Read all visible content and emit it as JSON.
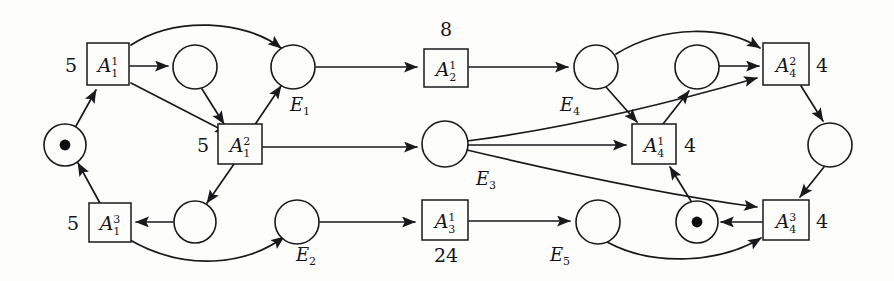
{
  "diagram": {
    "kind": "petri-net",
    "width": 894,
    "height": 281,
    "background_color": "#fdfdfb",
    "ink_color": "#19191c"
  },
  "transitions": [
    {
      "id": "a11",
      "base": "A",
      "sup": "1",
      "sub": "1",
      "weight": "5",
      "weight_pos": "left",
      "x": 108,
      "y": 64,
      "w": 42,
      "h": 42
    },
    {
      "id": "a12",
      "base": "A",
      "sup": "2",
      "sub": "1",
      "weight": "5",
      "weight_pos": "left",
      "x": 240,
      "y": 144,
      "w": 44,
      "h": 40
    },
    {
      "id": "a13",
      "base": "A",
      "sup": "3",
      "sub": "1",
      "weight": "5",
      "weight_pos": "left",
      "x": 110,
      "y": 222,
      "w": 42,
      "h": 39
    },
    {
      "id": "a21",
      "base": "A",
      "sup": "1",
      "sub": "2",
      "weight": "8",
      "weight_pos": "top",
      "x": 446,
      "y": 68,
      "w": 44,
      "h": 38
    },
    {
      "id": "a31",
      "base": "A",
      "sup": "1",
      "sub": "3",
      "weight": "24",
      "weight_pos": "bottom",
      "x": 445,
      "y": 220,
      "w": 46,
      "h": 40
    },
    {
      "id": "a41",
      "base": "A",
      "sup": "1",
      "sub": "4",
      "weight": "4",
      "weight_pos": "right",
      "x": 654,
      "y": 144,
      "w": 44,
      "h": 40
    },
    {
      "id": "a42",
      "base": "A",
      "sup": "2",
      "sub": "4",
      "weight": "4",
      "weight_pos": "right",
      "x": 786,
      "y": 64,
      "w": 46,
      "h": 42
    },
    {
      "id": "a43",
      "base": "A",
      "sup": "3",
      "sub": "4",
      "weight": "4",
      "weight_pos": "right",
      "x": 786,
      "y": 220,
      "w": 46,
      "h": 40
    }
  ],
  "places": [
    {
      "id": "p_start",
      "x": 65,
      "y": 145,
      "r": 21,
      "tokens": 1,
      "label": ""
    },
    {
      "id": "p_u1",
      "x": 195,
      "y": 67,
      "r": 22,
      "tokens": 0,
      "label": ""
    },
    {
      "id": "p_e1",
      "x": 293,
      "y": 67,
      "r": 22,
      "tokens": 0,
      "label": "E",
      "label_sub": "1",
      "label_x": 300,
      "label_y": 104
    },
    {
      "id": "p_l1",
      "x": 195,
      "y": 222,
      "r": 21,
      "tokens": 0,
      "label": ""
    },
    {
      "id": "p_e2",
      "x": 297,
      "y": 222,
      "r": 22,
      "tokens": 0,
      "label": "E",
      "label_sub": "2",
      "label_x": 306,
      "label_y": 254
    },
    {
      "id": "p_e3",
      "x": 445,
      "y": 144,
      "r": 23,
      "tokens": 0,
      "label": "E",
      "label_sub": "3",
      "label_x": 486,
      "label_y": 178
    },
    {
      "id": "p_e4",
      "x": 596,
      "y": 67,
      "r": 22,
      "tokens": 0,
      "label": "E",
      "label_sub": "4",
      "label_x": 570,
      "label_y": 104
    },
    {
      "id": "p_u2",
      "x": 697,
      "y": 67,
      "r": 22,
      "tokens": 0,
      "label": ""
    },
    {
      "id": "p_e5",
      "x": 598,
      "y": 222,
      "r": 22,
      "tokens": 0,
      "label": "E",
      "label_sub": "5",
      "label_x": 560,
      "label_y": 254
    },
    {
      "id": "p_tok2",
      "x": 697,
      "y": 222,
      "r": 21,
      "tokens": 1,
      "label": ""
    },
    {
      "id": "p_right",
      "x": 830,
      "y": 145,
      "r": 22,
      "tokens": 0,
      "label": ""
    }
  ],
  "arcs": [
    {
      "id": "arc-start-a11",
      "from": "p_start",
      "to": "a11",
      "shape": "line"
    },
    {
      "id": "arc-a11-u1",
      "from": "a11",
      "to": "p_u1",
      "shape": "line"
    },
    {
      "id": "arc-a11-e1",
      "from": "a11",
      "to": "p_e1",
      "shape": "curve-over"
    },
    {
      "id": "arc-a11-a12",
      "from": "a11",
      "to": "a12",
      "shape": "line"
    },
    {
      "id": "arc-u1-a12",
      "from": "p_u1",
      "to": "a12",
      "shape": "line"
    },
    {
      "id": "arc-a12-e1",
      "from": "a12",
      "to": "p_e1",
      "shape": "line"
    },
    {
      "id": "arc-a12-e3",
      "from": "a12",
      "to": "p_e3",
      "shape": "line"
    },
    {
      "id": "arc-a12-l1",
      "from": "a12",
      "to": "p_l1",
      "shape": "line"
    },
    {
      "id": "arc-l1-a13",
      "from": "p_l1",
      "to": "a13",
      "shape": "line"
    },
    {
      "id": "arc-a13-start",
      "from": "a13",
      "to": "p_start",
      "shape": "line"
    },
    {
      "id": "arc-a13-e2",
      "from": "a13",
      "to": "p_e2",
      "shape": "curve-under"
    },
    {
      "id": "arc-e1-a21",
      "from": "p_e1",
      "to": "a21",
      "shape": "line"
    },
    {
      "id": "arc-a21-e4",
      "from": "a21",
      "to": "p_e4",
      "shape": "line"
    },
    {
      "id": "arc-e2-a31",
      "from": "p_e2",
      "to": "a31",
      "shape": "line"
    },
    {
      "id": "arc-a31-e5",
      "from": "a31",
      "to": "p_e5",
      "shape": "line"
    },
    {
      "id": "arc-e3-a41",
      "from": "p_e3",
      "to": "a41",
      "shape": "line"
    },
    {
      "id": "arc-e3-a42",
      "from": "p_e3",
      "to": "a42",
      "shape": "curve"
    },
    {
      "id": "arc-e3-a43",
      "from": "p_e3",
      "to": "a43",
      "shape": "curve"
    },
    {
      "id": "arc-e4-a41",
      "from": "p_e4",
      "to": "a41",
      "shape": "line"
    },
    {
      "id": "arc-e4-a42",
      "from": "p_e4",
      "to": "a42",
      "shape": "curve-over"
    },
    {
      "id": "arc-a41-u2",
      "from": "a41",
      "to": "p_u2",
      "shape": "line"
    },
    {
      "id": "arc-u2-a42",
      "from": "p_u2",
      "to": "a42",
      "shape": "line"
    },
    {
      "id": "arc-a42-right",
      "from": "a42",
      "to": "p_right",
      "shape": "line"
    },
    {
      "id": "arc-right-a43",
      "from": "p_right",
      "to": "a43",
      "shape": "line"
    },
    {
      "id": "arc-a43-tok2",
      "from": "a43",
      "to": "p_tok2",
      "shape": "line"
    },
    {
      "id": "arc-tok2-a41",
      "from": "p_tok2",
      "to": "a41",
      "shape": "line"
    },
    {
      "id": "arc-e5-a43",
      "from": "p_e5",
      "to": "a43",
      "shape": "curve-under"
    }
  ]
}
